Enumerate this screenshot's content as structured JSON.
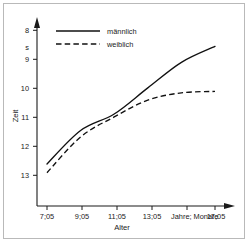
{
  "figure": {
    "background_color": "#ffffff",
    "border_color": "#b9b9b9",
    "line_color": "#111111"
  },
  "chart_data": {
    "type": "line",
    "title": "",
    "xlabel": "Alter",
    "ylabel": "Zeit",
    "x_unit_label": "Jahre; Monate",
    "y_unit_label": "s",
    "grid": false,
    "y_inverted": true,
    "ylim": [
      13.6,
      7.7
    ],
    "yticks": [
      8,
      9,
      10,
      11,
      12,
      13
    ],
    "ytick_labels": [
      "8",
      "9",
      "10",
      "11",
      "12",
      "13"
    ],
    "x": [
      "7;05",
      "9;05",
      "11;05",
      "13;05",
      "15;05",
      "17;05"
    ],
    "categories": [
      "7;05",
      "9;05",
      "11;05",
      "13;05",
      "15;05",
      "17;05"
    ],
    "xtick_labels": [
      "7;05",
      "9;05",
      "11;05",
      "13;05",
      "17;05"
    ],
    "legend_position": "top-left",
    "series": [
      {
        "name": "männlich",
        "style": "solid",
        "values": [
          12.5,
          11.35,
          10.78,
          9.88,
          9.0,
          8.45
        ]
      },
      {
        "name": "weiblich",
        "style": "dashed",
        "values": [
          12.8,
          11.57,
          10.88,
          10.3,
          10.05,
          10.0
        ]
      }
    ]
  },
  "axes": {
    "y_axis_name": "Zeit",
    "x_axis_name": "Alter",
    "y_unit": "s",
    "x_unit": "Jahre; Monate"
  },
  "legend": {
    "entries": [
      {
        "label": "männlich",
        "style": "solid"
      },
      {
        "label": "weiblich",
        "style": "dashed"
      }
    ]
  }
}
